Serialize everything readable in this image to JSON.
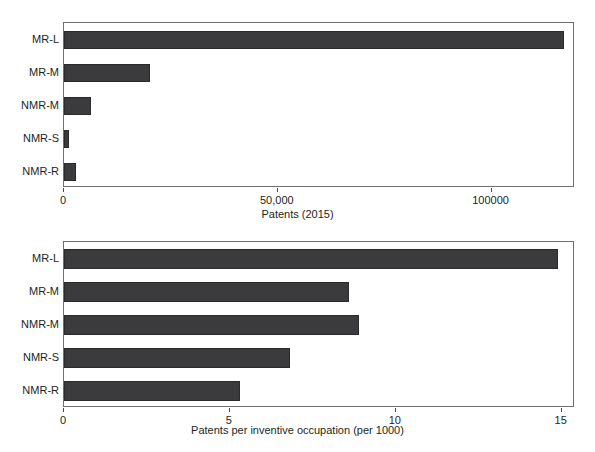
{
  "figure": {
    "cropped_header_text": "",
    "bar_color": "#3b3b3d",
    "axis_color": "#4a4a4c",
    "frame_color": "#6f6f72",
    "text_color": "#231f20"
  },
  "chart_data": [
    {
      "type": "bar",
      "orientation": "horizontal",
      "panel": "top",
      "title": "",
      "xlabel": "Patents (2015)",
      "ylabel": "",
      "categories": [
        "MR-L",
        "MR-M",
        "NMR-M",
        "NMR-S",
        "NMR-R"
      ],
      "values": [
        117000,
        20000,
        6300,
        1200,
        2800
      ],
      "xlim": [
        0,
        119500
      ],
      "xticks": [
        0,
        50000,
        100000
      ],
      "xticklabels": [
        "0",
        "50,000",
        "100000"
      ],
      "grid": false,
      "legend": null
    },
    {
      "type": "bar",
      "orientation": "horizontal",
      "panel": "bottom",
      "title": "",
      "xlabel": "Patents per inventive occupation (per 1000)",
      "ylabel": "",
      "categories": [
        "MR-L",
        "MR-M",
        "NMR-M",
        "NMR-S",
        "NMR-R"
      ],
      "values": [
        14.9,
        8.6,
        8.9,
        6.8,
        5.3
      ],
      "xlim": [
        0,
        15.4
      ],
      "xticks": [
        0,
        5,
        10,
        15
      ],
      "xticklabels": [
        "0",
        "5",
        "10",
        "15"
      ],
      "grid": false,
      "legend": null
    }
  ]
}
